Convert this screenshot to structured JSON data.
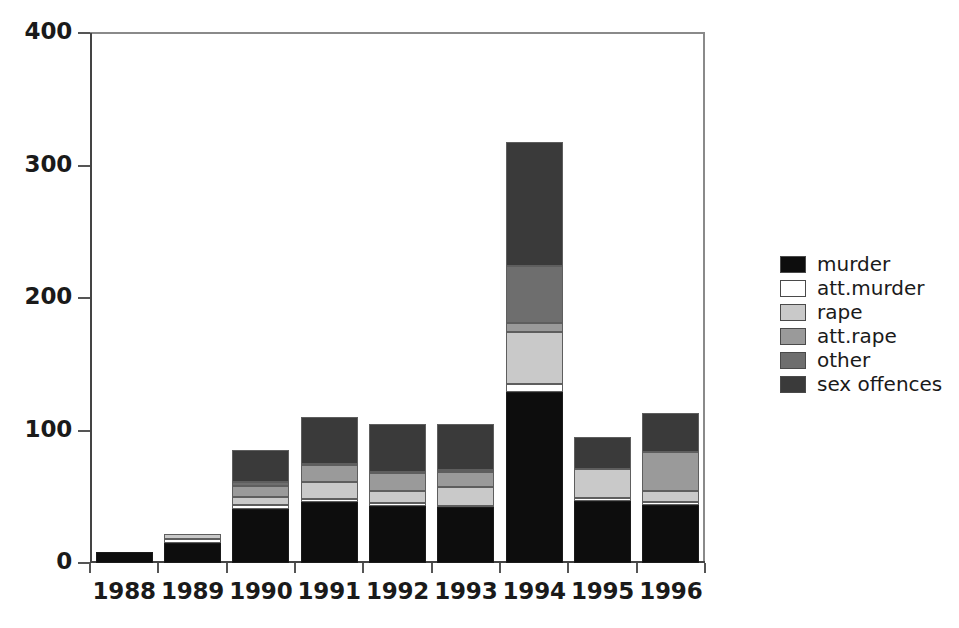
{
  "chart_data": {
    "type": "bar",
    "subtype": "stacked-bar",
    "title": "",
    "subtitle": "",
    "xlabel": "",
    "ylabel": "",
    "categories": [
      "1988",
      "1989",
      "1990",
      "1991",
      "1992",
      "1993",
      "1994",
      "1995",
      "1996"
    ],
    "ylim": [
      0,
      400
    ],
    "yticks": [
      0,
      100,
      200,
      300,
      400
    ],
    "ytick_labels": [
      "0",
      "100",
      "200",
      "300",
      "400"
    ],
    "grid": false,
    "legend_position": "right",
    "series": [
      {
        "name": "murder",
        "color": "#0d0d0d",
        "values": [
          8,
          15,
          41,
          46,
          43,
          42,
          129,
          47,
          44
        ]
      },
      {
        "name": "att.murder",
        "color": "#ffffff",
        "values": [
          0,
          3,
          3,
          2,
          2,
          1,
          6,
          2,
          2
        ]
      },
      {
        "name": "rape",
        "color": "#c9c9c9",
        "values": [
          0,
          4,
          6,
          13,
          9,
          14,
          39,
          22,
          8
        ]
      },
      {
        "name": "att.rape",
        "color": "#9a9a9a",
        "values": [
          0,
          0,
          8,
          13,
          14,
          12,
          7,
          0,
          30
        ]
      },
      {
        "name": "other",
        "color": "#6e6e6e",
        "values": [
          0,
          0,
          3,
          1,
          1,
          1,
          43,
          0,
          0
        ]
      },
      {
        "name": "sex offences",
        "color": "#3a3a3a",
        "values": [
          0,
          0,
          24,
          35,
          36,
          35,
          94,
          24,
          29
        ]
      }
    ],
    "totals": [
      8,
      22,
      85,
      110,
      105,
      105,
      318,
      95,
      113
    ]
  },
  "legend": {
    "items": [
      {
        "label": "murder",
        "color": "#0d0d0d"
      },
      {
        "label": "att.murder",
        "color": "#ffffff"
      },
      {
        "label": "rape",
        "color": "#c9c9c9"
      },
      {
        "label": "att.rape",
        "color": "#9a9a9a"
      },
      {
        "label": "other",
        "color": "#6e6e6e"
      },
      {
        "label": "sex offences",
        "color": "#3a3a3a"
      }
    ]
  },
  "axes": {
    "y_tick_labels": [
      "400",
      "300",
      "200",
      "100",
      "0"
    ],
    "x_tick_labels": [
      "1988",
      "1989",
      "1990",
      "1991",
      "1992",
      "1993",
      "1994",
      "1995",
      "1996"
    ]
  },
  "colors": {
    "axis": "#444444",
    "text": "#1a1a1a",
    "background": "#ffffff",
    "segment_border": "#5e5e5e"
  }
}
